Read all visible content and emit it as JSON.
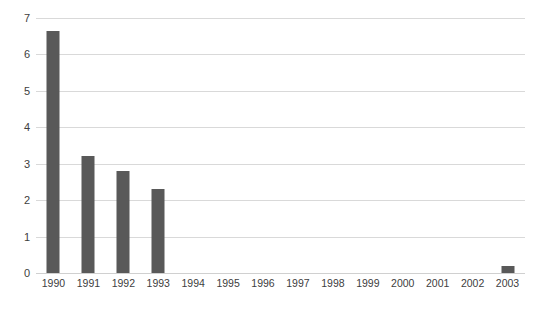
{
  "chart_data": {
    "type": "bar",
    "title": "Coefficient of Variation %",
    "xlabel": "",
    "ylabel": "",
    "categories": [
      "1990",
      "1991",
      "1992",
      "1993",
      "1994",
      "1995",
      "1996",
      "1997",
      "1998",
      "1999",
      "2000",
      "2001",
      "2002",
      "2003"
    ],
    "values": [
      6.65,
      3.2,
      2.8,
      2.3,
      0,
      0,
      0,
      0,
      0,
      0,
      0,
      0,
      0,
      0.2
    ],
    "series": [
      {
        "name": "Coefficient of Variation %",
        "values": [
          6.65,
          3.2,
          2.8,
          2.3,
          0,
          0,
          0,
          0,
          0,
          0,
          0,
          0,
          0,
          0.2
        ]
      }
    ],
    "ylim": [
      0,
      7
    ],
    "yticks": [
      0,
      1,
      2,
      3,
      4,
      5,
      6,
      7
    ],
    "ytick_labels": [
      "0",
      "1",
      "2",
      "3",
      "4",
      "5",
      "6",
      "7"
    ],
    "grid": "horizontal",
    "legend": "none",
    "bar_color": "#595959",
    "gridline_color": "#d9d9d9",
    "background_color": "#ffffff",
    "text_color": "#404040"
  }
}
